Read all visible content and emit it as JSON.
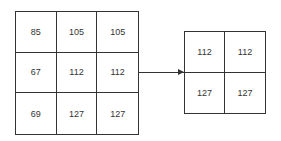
{
  "input_matrix": {
    "rows": [
      [
        "85",
        "105",
        "105"
      ],
      [
        "67",
        "112",
        "112"
      ],
      [
        "69",
        "127",
        "127"
      ]
    ]
  },
  "output_matrix": {
    "rows": [
      [
        "112",
        "112"
      ],
      [
        "127",
        "127"
      ]
    ]
  },
  "colors": {
    "line": "#333333",
    "text": "#333333",
    "background": "#ffffff"
  }
}
